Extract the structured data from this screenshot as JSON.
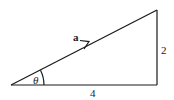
{
  "diagram": {
    "type": "right-triangle-vector",
    "vector_label": "a",
    "angle_label": "θ",
    "vertical_side_label": "2",
    "horizontal_side_label": "4",
    "stroke_color": "#1a1a1a"
  }
}
